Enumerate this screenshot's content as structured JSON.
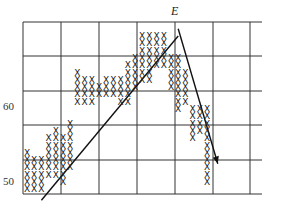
{
  "chart_data": {
    "type": "point-and-figure",
    "title": "",
    "annotation": "E",
    "y_tick_labels": [
      "60",
      "50"
    ],
    "ylim": [
      47,
      72
    ],
    "grid": {
      "vertical_lines": 7,
      "horizontal_lines": 6
    },
    "trendlines": [
      {
        "name": "uptrend-line",
        "from_col": 2,
        "from_price": 47.5,
        "to_col": 21,
        "to_price": 70
      },
      {
        "name": "downtrend-arrow",
        "from_col": 21,
        "from_price": 71,
        "to_col": 26.5,
        "to_price": 52.5
      }
    ],
    "columns": [
      {
        "col": 0,
        "low": 49,
        "high": 54
      },
      {
        "col": 1,
        "low": 49,
        "high": 53
      },
      {
        "col": 2,
        "low": 49,
        "high": 53
      },
      {
        "col": 3,
        "low": 51,
        "high": 56
      },
      {
        "col": 4,
        "low": 51,
        "high": 57
      },
      {
        "col": 5,
        "low": 50,
        "high": 56
      },
      {
        "col": 6,
        "low": 52,
        "high": 58
      },
      {
        "col": 7,
        "low": 61,
        "high": 65
      },
      {
        "col": 8,
        "low": 61,
        "high": 64
      },
      {
        "col": 9,
        "low": 61,
        "high": 64
      },
      {
        "col": 10,
        "low": 62,
        "high": 63
      },
      {
        "col": 11,
        "low": 62,
        "high": 64
      },
      {
        "col": 12,
        "low": 62,
        "high": 64
      },
      {
        "col": 13,
        "low": 61,
        "high": 64
      },
      {
        "col": 14,
        "low": 61,
        "high": 66
      },
      {
        "col": 15,
        "low": 63,
        "high": 67
      },
      {
        "col": 16,
        "low": 64,
        "high": 70
      },
      {
        "col": 17,
        "low": 64,
        "high": 70
      },
      {
        "col": 18,
        "low": 66,
        "high": 70
      },
      {
        "col": 19,
        "low": 66,
        "high": 70
      },
      {
        "col": 20,
        "low": 63,
        "high": 67
      },
      {
        "col": 21,
        "low": 60,
        "high": 67
      },
      {
        "col": 22,
        "low": 61,
        "high": 65
      },
      {
        "col": 23,
        "low": 56,
        "high": 60
      },
      {
        "col": 24,
        "low": 57,
        "high": 60
      },
      {
        "col": 25,
        "low": 50,
        "high": 60
      }
    ]
  },
  "labels": {
    "y60": "60",
    "y50": "50",
    "event": "E",
    "mark": "X"
  }
}
